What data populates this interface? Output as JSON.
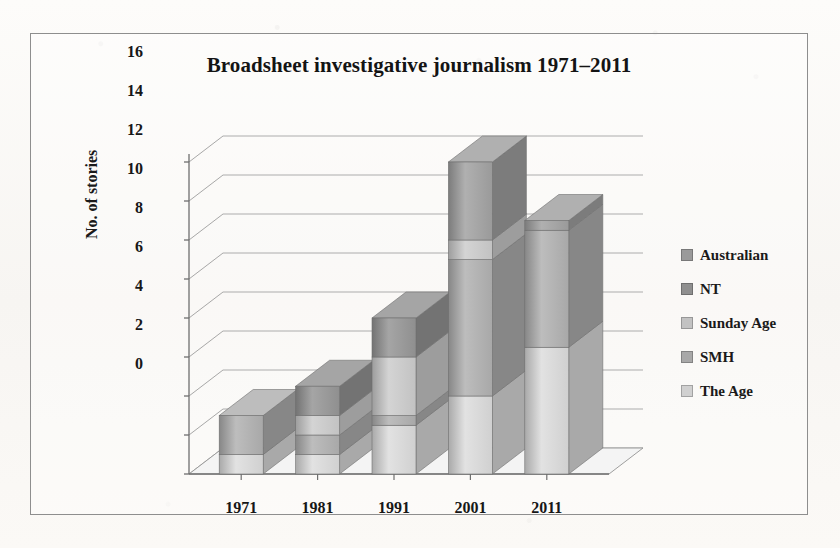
{
  "chart_data": {
    "type": "bar",
    "subtype": "stacked-column-3d",
    "title": "Broadsheet investigative journalism 1971–2011",
    "xlabel": "",
    "ylabel": "No. of stories",
    "categories": [
      "1971",
      "1981",
      "1991",
      "2001",
      "2011"
    ],
    "ylim": [
      0,
      16
    ],
    "yticks": [
      0,
      2,
      4,
      6,
      8,
      10,
      12,
      14,
      16
    ],
    "ytick_labels": [
      "0",
      "2",
      "4",
      "6",
      "8",
      "10",
      "12",
      "14",
      "16"
    ],
    "grid": true,
    "legend_position": "right",
    "series": [
      {
        "name": "The Age",
        "color": "#d0d0d0",
        "side_color": "#a9a9a9",
        "top_color": "#e2e2e2",
        "values": [
          1,
          1,
          2.5,
          4,
          6.5
        ]
      },
      {
        "name": "SMH",
        "color": "#a8a8a8",
        "side_color": "#878787",
        "top_color": "#bdbdbd",
        "values": [
          2,
          1,
          0.5,
          7,
          6
        ]
      },
      {
        "name": "Sunday Age",
        "color": "#c2c2c2",
        "side_color": "#9d9d9d",
        "top_color": "#d4d4d4",
        "values": [
          0,
          1,
          3,
          1,
          0
        ]
      },
      {
        "name": "NT",
        "color": "#8f8f8f",
        "side_color": "#737373",
        "top_color": "#a5a5a5",
        "values": [
          0,
          1.5,
          2,
          0,
          0
        ]
      },
      {
        "name": "Australian",
        "color": "#9a9a9a",
        "side_color": "#7c7c7c",
        "top_color": "#b0b0b0",
        "values": [
          0,
          0,
          0,
          4,
          0.5
        ]
      }
    ],
    "totals": [
      3,
      4.5,
      8,
      16,
      13
    ]
  },
  "legend": {
    "items": [
      {
        "label": "Australian",
        "color": "#9a9a9a"
      },
      {
        "label": "NT",
        "color": "#8f8f8f"
      },
      {
        "label": "Sunday Age",
        "color": "#c2c2c2"
      },
      {
        "label": "SMH",
        "color": "#a8a8a8"
      },
      {
        "label": "The Age",
        "color": "#d0d0d0"
      }
    ]
  },
  "colors": {
    "frame_border": "#8e8e8e",
    "gridline": "#9a9a9a",
    "axis": "#6f6f6f",
    "text": "#141414",
    "floor": "#f4f4f4",
    "background": "#fbfaf8"
  }
}
